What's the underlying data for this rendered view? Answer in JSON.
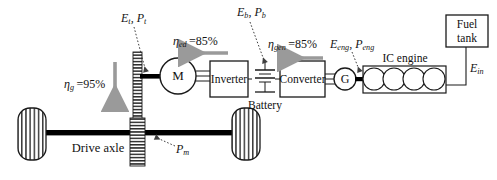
{
  "diagram": {
    "colors": {
      "stroke": "#1a1a1a",
      "shaft": "#000000",
      "arrow_gray": "#9a9a9a",
      "leader": "#4a4a4a",
      "hatch": "#2b2b2b",
      "background": "#ffffff"
    }
  },
  "components": {
    "motor": {
      "label": "M",
      "name": "electric-motor"
    },
    "inverter": {
      "label": "Inverter"
    },
    "battery": {
      "label": "Battery"
    },
    "converter": {
      "label": "Converter"
    },
    "generator": {
      "label": "G",
      "name": "generator"
    },
    "ic_engine": {
      "label": "IC engine",
      "cylinders": 4
    },
    "fuel_tank": {
      "label": "Fuel\ntank",
      "line1": "Fuel",
      "line2": "tank"
    },
    "drive_axle": {
      "label": "Drive axle"
    },
    "gearbox": {
      "name": "gearbox-hatched-bar"
    },
    "wheel_left": {
      "name": "wheel-left"
    },
    "wheel_right": {
      "name": "wheel-right"
    }
  },
  "efficiencies": [
    {
      "id": "gearbox",
      "symbol": "η",
      "subscript": "g",
      "value": "95%",
      "text": "ηg =95%"
    },
    {
      "id": "electric-drive",
      "symbol": "η",
      "subscript": "ed",
      "value": "85%",
      "text": "ηed =85%"
    },
    {
      "id": "generator",
      "symbol": "η",
      "subscript": "gen",
      "value": "85%",
      "text": "ηgen =85%"
    }
  ],
  "energy_labels": [
    {
      "id": "traction",
      "text": "Et, Pt",
      "terms": [
        "E",
        "t",
        "P",
        "t"
      ]
    },
    {
      "id": "battery",
      "text": "Eb, Pb",
      "terms": [
        "E",
        "b",
        "P",
        "b"
      ]
    },
    {
      "id": "engine",
      "text": "Eeng, Peng",
      "terms": [
        "E",
        "eng",
        "P",
        "eng"
      ]
    },
    {
      "id": "fuel-input",
      "text": "Ein",
      "terms": [
        "E",
        "in"
      ]
    },
    {
      "id": "mechanical-power",
      "text": "Pm",
      "terms": [
        "P",
        "m"
      ]
    }
  ],
  "arrows": [
    {
      "id": "gearbox-flow",
      "direction": "down"
    },
    {
      "id": "electric-drive-flow",
      "direction": "left"
    },
    {
      "id": "generator-flow",
      "direction": "left"
    }
  ]
}
